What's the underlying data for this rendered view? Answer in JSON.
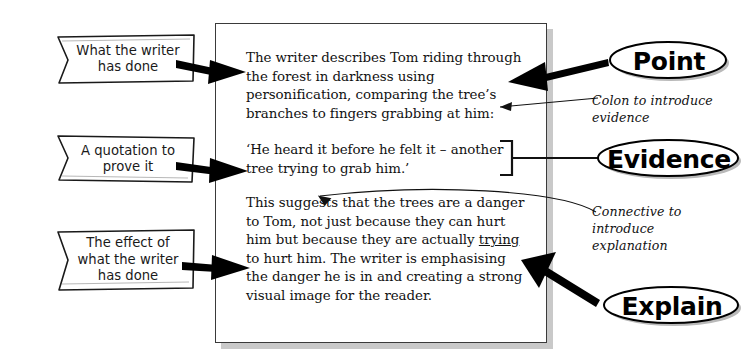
{
  "document_box": {
    "paragraphs": [
      {
        "id": "point",
        "text": "The writer describes Tom riding through the forest in darkness using personification, comparing the tree’s branches to fingers grabbing at him:"
      },
      {
        "id": "evidence",
        "text": "‘He heard it before he felt it – another tree trying to grab him.’"
      },
      {
        "id": "explain",
        "text_before": "This suggests that the trees are a danger to Tom, not just because they can hurt him but because they are actually ",
        "underlined_word": "trying",
        "text_after": " to hurt him. The writer is emphasising the danger he is in and creating a strong visual image for the reader."
      }
    ]
  },
  "callouts": [
    {
      "id": "what-the-writer-has-done",
      "line1": "What the writer",
      "line2": "has done",
      "line3": ""
    },
    {
      "id": "a-quotation-to-prove-it",
      "line1": "A quotation to",
      "line2": "prove it",
      "line3": ""
    },
    {
      "id": "the-effect-of-what-the-writer-has-done",
      "line1": "The effect of",
      "line2": "what the writer",
      "line3": "has done"
    }
  ],
  "stage_labels": [
    {
      "id": "point",
      "label": "Point"
    },
    {
      "id": "evidence",
      "label": "Evidence"
    },
    {
      "id": "explain",
      "label": "Explain"
    }
  ],
  "annotations": [
    {
      "id": "colon-note",
      "line1": "Colon to introduce",
      "line2": "evidence",
      "line3": ""
    },
    {
      "id": "connective-note",
      "line1": "Connective to",
      "line2": "introduce",
      "line3": "explanation"
    }
  ],
  "colors": {
    "ink": "#111111",
    "box_border": "#3a3a3a",
    "box_shadow": "#c9c9c9",
    "arrow": "#000000",
    "page": "#ffffff"
  }
}
